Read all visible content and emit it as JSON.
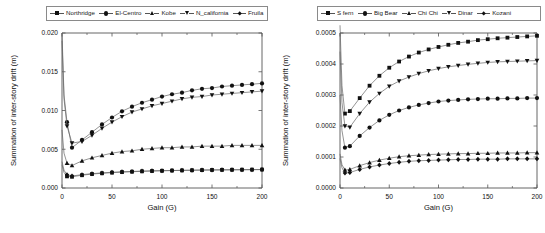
{
  "chart_data": [
    {
      "type": "line",
      "panel": "left",
      "title": "",
      "xlabel": "Gain (G)",
      "ylabel": "Summation of inter-story drift (m)",
      "xlim": [
        0,
        200
      ],
      "ylim": [
        0.0,
        0.02
      ],
      "xticks": [
        0,
        50,
        100,
        150,
        200
      ],
      "xtick_labels": [
        "0",
        "50",
        "100",
        "150",
        "200"
      ],
      "yticks": [
        0.0,
        0.005,
        0.01,
        0.015,
        0.02
      ],
      "ytick_labels": [
        "0.000",
        "0.005",
        "0.010",
        "0.015",
        "0.020"
      ],
      "grid": false,
      "legend_position": "top",
      "x": [
        0,
        2,
        5,
        10,
        20,
        30,
        40,
        50,
        60,
        70,
        80,
        90,
        100,
        110,
        120,
        130,
        140,
        150,
        160,
        170,
        180,
        190,
        200
      ],
      "series": [
        {
          "name": "Northridge",
          "marker": "square",
          "values": [
            0.003,
            0.002,
            0.0015,
            0.00145,
            0.00165,
            0.0018,
            0.0019,
            0.00198,
            0.00205,
            0.0021,
            0.00215,
            0.00219,
            0.00222,
            0.00225,
            0.00227,
            0.00229,
            0.00231,
            0.00233,
            0.00234,
            0.00235,
            0.00236,
            0.00237,
            0.00238
          ]
        },
        {
          "name": "El-Centro",
          "marker": "circle",
          "values": [
            0.02,
            0.012,
            0.0085,
            0.0052,
            0.0062,
            0.0072,
            0.0082,
            0.0091,
            0.0099,
            0.0105,
            0.011,
            0.0114,
            0.0118,
            0.0121,
            0.0123,
            0.0126,
            0.0128,
            0.0129,
            0.0131,
            0.0132,
            0.0133,
            0.0134,
            0.0135
          ]
        },
        {
          "name": "Kobe",
          "marker": "triangle-up",
          "values": [
            0.0075,
            0.0045,
            0.0032,
            0.0029,
            0.0035,
            0.0039,
            0.0042,
            0.0045,
            0.0047,
            0.0048,
            0.005,
            0.0051,
            0.0052,
            0.0052,
            0.0053,
            0.0053,
            0.0054,
            0.0054,
            0.0054,
            0.0055,
            0.0055,
            0.0055,
            0.0055
          ]
        },
        {
          "name": "N_california",
          "marker": "triangle-down",
          "values": [
            0.019,
            0.0115,
            0.008,
            0.0058,
            0.006,
            0.0068,
            0.0077,
            0.0085,
            0.0092,
            0.0098,
            0.0102,
            0.0106,
            0.0109,
            0.0112,
            0.0115,
            0.0117,
            0.0118,
            0.012,
            0.0121,
            0.0122,
            0.0123,
            0.0124,
            0.0125
          ]
        },
        {
          "name": "Fruila",
          "marker": "diamond",
          "values": [
            0.0034,
            0.0023,
            0.0017,
            0.00155,
            0.00172,
            0.00185,
            0.00195,
            0.00203,
            0.00209,
            0.00214,
            0.00218,
            0.00221,
            0.00224,
            0.00226,
            0.00228,
            0.0023,
            0.00232,
            0.00233,
            0.00234,
            0.00235,
            0.00236,
            0.00237,
            0.00238
          ]
        }
      ]
    },
    {
      "type": "line",
      "panel": "right",
      "title": "",
      "xlabel": "Gain (G)",
      "ylabel": "Summation of inter-story drift (m)",
      "xlim": [
        0,
        200
      ],
      "ylim": [
        0.0,
        0.0005
      ],
      "xticks": [
        0,
        50,
        100,
        150,
        200
      ],
      "xtick_labels": [
        "0",
        "50",
        "100",
        "150",
        "200"
      ],
      "yticks": [
        0.0,
        0.0001,
        0.0002,
        0.0003,
        0.0004,
        0.0005
      ],
      "ytick_labels": [
        "0.0000",
        "0.0001",
        "0.0002",
        "0.0003",
        "0.0004",
        "0.0005"
      ],
      "grid": false,
      "legend_position": "top",
      "x": [
        0,
        2,
        5,
        10,
        20,
        30,
        40,
        50,
        60,
        70,
        80,
        90,
        100,
        110,
        120,
        130,
        140,
        150,
        160,
        170,
        180,
        190,
        200
      ],
      "series": [
        {
          "name": "S fern",
          "marker": "square",
          "values": [
            0.000525,
            0.00033,
            0.00024,
            0.000248,
            0.00029,
            0.00033,
            0.000362,
            0.000388,
            0.000408,
            0.000424,
            0.000437,
            0.000447,
            0.000455,
            0.000462,
            0.000468,
            0.000472,
            0.000477,
            0.00048,
            0.000483,
            0.000485,
            0.000487,
            0.000489,
            0.000491
          ]
        },
        {
          "name": "Big Bear",
          "marker": "circle",
          "values": [
            0.0003,
            0.000185,
            0.00013,
            0.000135,
            0.000168,
            0.000195,
            0.000218,
            0.000236,
            0.00025,
            0.00026,
            0.000268,
            0.000274,
            0.000279,
            0.000282,
            0.000284,
            0.000286,
            0.000287,
            0.000288,
            0.000288,
            0.000289,
            0.000289,
            0.00029,
            0.00029
          ]
        },
        {
          "name": "Chi Chi",
          "marker": "triangle-up",
          "values": [
            0.00011,
            7.5e-05,
            5.8e-05,
            6e-05,
            7.2e-05,
            8.2e-05,
            9e-05,
            9.6e-05,
            0.000101,
            0.000104,
            0.000106,
            0.000108,
            0.000109,
            0.00011,
            0.000111,
            0.000111,
            0.000112,
            0.000112,
            0.000113,
            0.000113,
            0.000113,
            0.000114,
            0.000114
          ]
        },
        {
          "name": "Dinar",
          "marker": "triangle-down",
          "values": [
            0.00044,
            0.000275,
            0.0002,
            0.000196,
            0.00024,
            0.000277,
            0.000305,
            0.000328,
            0.000345,
            0.000358,
            0.000369,
            0.000378,
            0.000385,
            0.000391,
            0.000395,
            0.000399,
            0.000402,
            0.000405,
            0.000407,
            0.000408,
            0.000409,
            0.00041,
            0.000411
          ]
        },
        {
          "name": "Kozani",
          "marker": "diamond",
          "values": [
            9.5e-05,
            6.5e-05,
            4.8e-05,
            5e-05,
            6e-05,
            6.8e-05,
            7.4e-05,
            7.9e-05,
            8.3e-05,
            8.6e-05,
            8.8e-05,
            8.9e-05,
            9e-05,
            9.1e-05,
            9.2e-05,
            9.2e-05,
            9.3e-05,
            9.3e-05,
            9.3e-05,
            9.4e-05,
            9.4e-05,
            9.4e-05,
            9.4e-05
          ]
        }
      ]
    }
  ],
  "left_panel": {
    "legend": [
      {
        "label": "Northridge",
        "marker": "square"
      },
      {
        "label": "El-Centro",
        "marker": "circle"
      },
      {
        "label": "Kobe",
        "marker": "triangle-up"
      },
      {
        "label": "N_california",
        "marker": "triangle-down"
      },
      {
        "label": "Fruila",
        "marker": "diamond"
      }
    ],
    "xlabel": "Gain (G)",
    "ylabel": "Summation of inter-story drift (m)"
  },
  "right_panel": {
    "legend": [
      {
        "label": "S fern",
        "marker": "square"
      },
      {
        "label": "Big Bear",
        "marker": "circle"
      },
      {
        "label": "Chi Chi",
        "marker": "triangle-up"
      },
      {
        "label": "Dinar",
        "marker": "triangle-down"
      },
      {
        "label": "Kozani",
        "marker": "diamond"
      }
    ],
    "xlabel": "Gain (G)",
    "ylabel": "Summation of inter-story drift (m)"
  },
  "colors": {
    "marker": "#111111",
    "line": "#666666",
    "axis": "#555555",
    "text": "#111111",
    "background": "#ffffff"
  }
}
